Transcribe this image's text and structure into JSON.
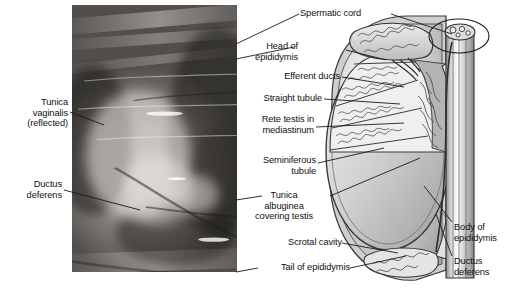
{
  "figure": {
    "panels": [
      {
        "id": "photo",
        "kind": "dissection-photograph",
        "description": "Grayscale photograph of dissected scrotal contents with tunica vaginalis reflected"
      },
      {
        "id": "schematic",
        "kind": "sagittal-section-diagram",
        "description": "Line-art sagittal section of testis, epididymis and spermatic cord"
      }
    ]
  },
  "labels": {
    "photo_left": [
      {
        "key": "tunica-vaginalis-reflected",
        "text": "Tunica\nvaginalis\n(reflected)"
      },
      {
        "key": "ductus-deferens-photo",
        "text": "Ductus\ndeferens"
      }
    ],
    "schematic_top": [
      {
        "key": "spermatic-cord",
        "text": "Spermatic cord"
      }
    ],
    "schematic_middle": [
      {
        "key": "head-of-epididymis",
        "text": "Head of\nepididymis"
      },
      {
        "key": "efferent-ducts",
        "text": "Efferent ducts"
      },
      {
        "key": "straight-tubule",
        "text": "Straight tubule"
      },
      {
        "key": "rete-testis-in-mediastinum",
        "text": "Rete testis in\nmediastinum"
      },
      {
        "key": "seminiferous-tubule",
        "text": "Seminiferous\ntubule"
      },
      {
        "key": "tunica-albuginea-covering-testis",
        "text": "Tunica\nalbuginea\ncovering testis"
      },
      {
        "key": "scrotal-cavity",
        "text": "Scrotal cavity"
      },
      {
        "key": "tail-of-epididymis",
        "text": "Tail of epididymis"
      }
    ],
    "schematic_right": [
      {
        "key": "body-of-epididymis",
        "text": "Body of\nepididymis"
      },
      {
        "key": "ductus-deferens-schematic",
        "text": "Ductus\ndeferens"
      }
    ]
  },
  "colors": {
    "background": "#ffffff",
    "text": "#111111",
    "leader_line": "#1a1a1a",
    "outline": "#2b2b2b",
    "testis_fill_light": "#e8e8e8",
    "testis_fill_mid": "#c2c2c2",
    "testis_fill_dark": "#9a9a9a",
    "tubule_fill": "#f2f2f2",
    "septum_fill": "#8d8d8d",
    "cord_fill": "#d4d4d4"
  }
}
